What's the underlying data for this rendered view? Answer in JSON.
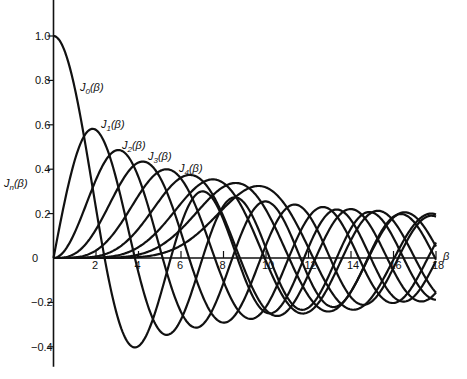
{
  "chart_data": {
    "type": "line",
    "title": "",
    "xlabel": "β",
    "ylabel": "Jn(β)",
    "xlim": [
      0,
      18
    ],
    "ylim": [
      -0.4,
      1.0
    ],
    "grid": false,
    "legend_position": "inline labels near curve peaks",
    "x_ticks": [
      2,
      4,
      6,
      8,
      10,
      12,
      14,
      16,
      18
    ],
    "y_ticks": [
      -0.4,
      -0.2,
      0,
      0.2,
      0.4,
      0.6,
      0.8,
      1.0
    ],
    "y_tick_labels": [
      "−0.4",
      "−0.2",
      "0",
      "0.2",
      "0.4",
      "0.6",
      "0.8",
      "1.0"
    ],
    "series": [
      {
        "name": "J0(β)",
        "order": 0,
        "value_at_0": 1.0,
        "first_min": {
          "x": 3.83,
          "y": -0.4
        }
      },
      {
        "name": "J1(β)",
        "order": 1,
        "peak": {
          "x": 1.84,
          "y": 0.58
        }
      },
      {
        "name": "J2(β)",
        "order": 2,
        "peak": {
          "x": 3.05,
          "y": 0.49
        }
      },
      {
        "name": "J3(β)",
        "order": 3,
        "peak": {
          "x": 4.2,
          "y": 0.43
        }
      },
      {
        "name": "J4(β)",
        "order": 4,
        "peak": {
          "x": 5.32,
          "y": 0.4
        }
      },
      {
        "name": "J5(β)",
        "order": 5,
        "peak": {
          "x": 6.42,
          "y": 0.37
        }
      },
      {
        "name": "J6(β)",
        "order": 6,
        "peak": {
          "x": 7.5,
          "y": 0.34
        }
      },
      {
        "name": "J7(β)",
        "order": 7,
        "peak": {
          "x": 8.58,
          "y": 0.33
        }
      },
      {
        "name": "J8(β)",
        "order": 8,
        "peak": {
          "x": 9.65,
          "y": 0.31
        }
      }
    ]
  },
  "labels": {
    "y_axis": "Jn(β)",
    "x_axis": "β",
    "curves": [
      "J0(β)",
      "J1(β)",
      "J2(β)",
      "J3(β)",
      "J4(β)"
    ]
  }
}
